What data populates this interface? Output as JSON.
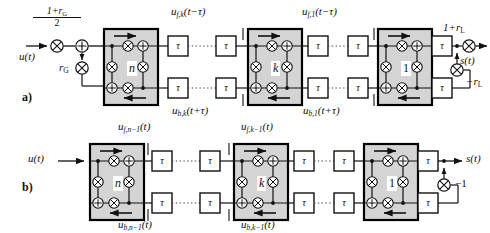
{
  "figure": {
    "type": "signal-flow-block-diagram",
    "panels": [
      {
        "id": "a",
        "label": "a)",
        "input_label": "u(t)",
        "output_label": "s(t)",
        "gain_input_numerator": "1+r",
        "gain_input_numerator_sub": "G",
        "gain_input_denominator": "2",
        "gain_reflect_input": "r",
        "gain_reflect_input_sub": "G",
        "gain_output": "1+r",
        "gain_output_sub": "L",
        "gain_feedback": "−r",
        "gain_feedback_sub": "L",
        "stages": [
          {
            "index_label": "n"
          },
          {
            "index_label": "k"
          },
          {
            "index_label": "1"
          }
        ],
        "signal_labels": [
          {
            "base": "u",
            "sub": "f,k",
            "arg": "(t−τ)",
            "position": "top-middle"
          },
          {
            "base": "u",
            "sub": "b,k",
            "arg": "(t+τ)",
            "position": "bottom-middle"
          },
          {
            "base": "u",
            "sub": "f,1",
            "arg": "(t−τ)",
            "position": "top-right"
          },
          {
            "base": "u",
            "sub": "b,1",
            "arg": "(t+τ)",
            "position": "bottom-right"
          }
        ]
      },
      {
        "id": "b",
        "label": "b)",
        "input_label": "u(t)",
        "output_label": "s(t)",
        "gain_feedback": "−1",
        "stages": [
          {
            "index_label": "n"
          },
          {
            "index_label": "k"
          },
          {
            "index_label": "1"
          }
        ],
        "signal_labels": [
          {
            "base": "u",
            "sub": "f,n−1",
            "arg": "(t)",
            "position": "top-left"
          },
          {
            "base": "u",
            "sub": "b,n−1",
            "arg": "(t)",
            "position": "bottom-left"
          },
          {
            "base": "u",
            "sub": "f,k−1",
            "arg": "(t)",
            "position": "top-middle"
          },
          {
            "base": "u",
            "sub": "b,k−1",
            "arg": "(t)",
            "position": "bottom-middle"
          }
        ]
      }
    ],
    "delay_element_label": "τ",
    "operator_multiply": "⊗",
    "operator_add": "⊕",
    "colors": {
      "background": "#ffffff",
      "stroke": "#111111",
      "block_fill": "#d4d4d4",
      "block_border": "#000000",
      "dotted_connector": "#555555"
    }
  },
  "text": {
    "panel_a_id": "a)",
    "panel_b_id": "b)",
    "u_of_t": "u(t)",
    "s_of_t": "s(t)",
    "tau": "τ",
    "num_1_plus_rG": "1+r",
    "den_2": "2",
    "sub_G": "G",
    "sub_L": "L",
    "rG": "r",
    "one_plus_rL": "1+r",
    "minus_rL": "−r",
    "minus_one": "−1",
    "stage_n": "n",
    "stage_k": "k",
    "stage_1": "1",
    "lbl_uf_k": "u",
    "lbl_uf_k_sub": "f,k",
    "lbl_uf_k_arg": "(t−τ)",
    "lbl_ub_k": "u",
    "lbl_ub_k_sub": "b,k",
    "lbl_ub_k_arg": "(t+τ)",
    "lbl_uf_1": "u",
    "lbl_uf_1_sub": "f,1",
    "lbl_uf_1_arg": "(t−τ)",
    "lbl_ub_1": "u",
    "lbl_ub_1_sub": "b,1",
    "lbl_ub_1_arg": "(t+τ)",
    "lbl_ufn1": "u",
    "lbl_ufn1_sub": "f,n−1",
    "lbl_ufn1_arg": "(t)",
    "lbl_ubn1": "u",
    "lbl_ubn1_sub": "b,n−1",
    "lbl_ubn1_arg": "(t)",
    "lbl_ufk1": "u",
    "lbl_ufk1_sub": "f,k−1",
    "lbl_ufk1_arg": "(t)",
    "lbl_ubk1": "u",
    "lbl_ubk1_sub": "b,k−1",
    "lbl_ubk1_arg": "(t)"
  }
}
